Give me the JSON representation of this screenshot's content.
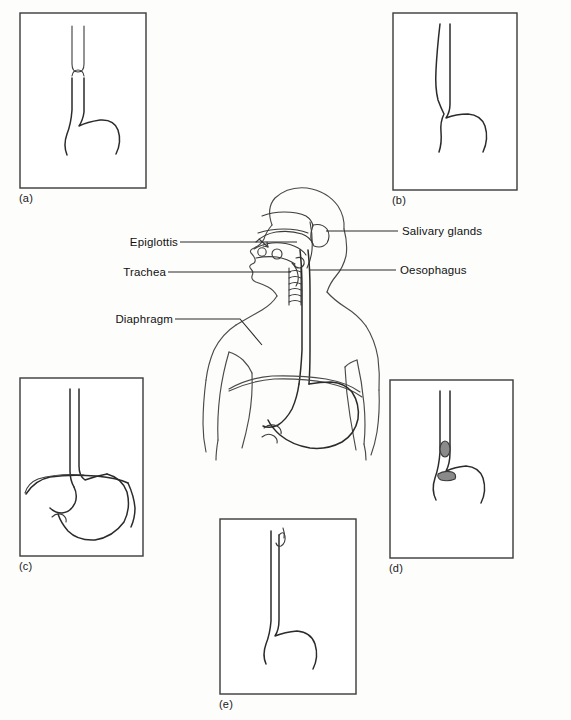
{
  "annotations": {
    "left": [
      {
        "id": "epiglottis",
        "label": "Epiglottis"
      },
      {
        "id": "trachea",
        "label": "Trachea"
      },
      {
        "id": "diaphragm",
        "label": "Diaphragm"
      }
    ],
    "right": [
      {
        "id": "salivary-glands",
        "label": "Salivary glands"
      },
      {
        "id": "oesophagus",
        "label": "Oesophagus"
      }
    ]
  },
  "panels": [
    {
      "id": "a",
      "label": "(a)",
      "caption": "Oesophagus with bolus entering at top"
    },
    {
      "id": "b",
      "label": "(b)",
      "caption": "Oesophagus distended near upper region"
    },
    {
      "id": "c",
      "label": "(c)",
      "caption": "Full stomach with oesophagus above"
    },
    {
      "id": "d",
      "label": "(d)",
      "caption": "Bolus travelling down the oesophagus"
    },
    {
      "id": "e",
      "label": "(e)",
      "caption": "Narrow oesophagus with hook at top"
    }
  ],
  "colors": {
    "background": "#fdfdfc",
    "stroke": "#2b2b2b",
    "box_stroke": "#3a3a3a",
    "bolus_fill": "#8a8a8a",
    "text": "#111111"
  }
}
